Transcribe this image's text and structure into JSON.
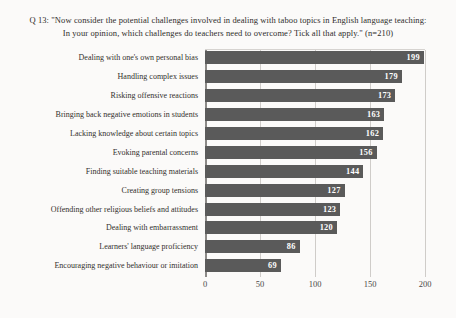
{
  "chart_data": {
    "type": "bar",
    "orientation": "horizontal",
    "title": "Q 13: \"Now consider the potential challenges involved in dealing with taboo topics in English language teaching: In your opinion, which challenges do teachers need to overcome? Tick all that apply.\" (n=210)",
    "categories": [
      "Dealing with one's own personal bias",
      "Handling complex issues",
      "Risking offensive reactions",
      "Bringing back negative emotions in students",
      "Lacking knowledge about certain topics",
      "Evoking parental concerns",
      "Finding suitable teaching materials",
      "Creating group tensions",
      "Offending other religious beliefs and attitudes",
      "Dealing with embarrassment",
      "Learners' language proficiency",
      "Encouraging negative behaviour or imitation"
    ],
    "values": [
      199,
      179,
      173,
      163,
      162,
      156,
      144,
      127,
      123,
      120,
      86,
      69
    ],
    "xlim": [
      0,
      200
    ],
    "x_ticks": [
      0,
      50,
      100,
      150,
      200
    ],
    "xlabel": "",
    "ylabel": "",
    "grid": "vertical",
    "legend": "none",
    "bar_color": "#5a5a5a",
    "value_label_color": "#ffffff",
    "gridline_color": "#cfccc9"
  }
}
